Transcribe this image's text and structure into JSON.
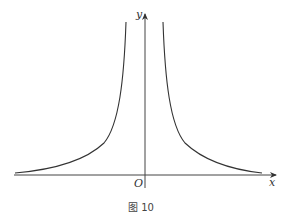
{
  "figure": {
    "caption": "图 10",
    "axes": {
      "x_label": "x",
      "y_label": "y",
      "origin_label": "O"
    },
    "curve_description": "Two symmetric branches rising toward the y-axis as vertical asymptote and approaching the x-axis as horizontal asymptote (y = k/x^2 type)"
  },
  "colors": {
    "background": "#ffffff",
    "stroke": "#333333"
  }
}
